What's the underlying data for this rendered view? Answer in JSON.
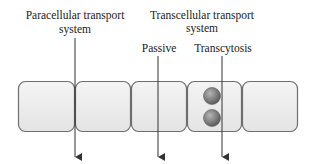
{
  "diagram": {
    "labels": {
      "paracellular_line1": "Paracellular transport",
      "paracellular_line2": "system",
      "transcellular_line1": "Transcellular transport",
      "transcellular_line2": "system",
      "passive": "Passive",
      "transcytosis": "Transcytosis"
    },
    "cells": [
      {
        "id": "cell-1",
        "has_vesicles": false
      },
      {
        "id": "cell-2",
        "has_vesicles": false
      },
      {
        "id": "cell-3",
        "has_vesicles": false
      },
      {
        "id": "cell-4",
        "has_vesicles": true,
        "vesicle_count": 2
      },
      {
        "id": "cell-5",
        "has_vesicles": false
      }
    ],
    "pathways": [
      {
        "name": "paracellular",
        "route": "between cells 1 and 2"
      },
      {
        "name": "passive",
        "route": "through cell 3"
      },
      {
        "name": "transcytosis",
        "route": "through cell 4"
      }
    ],
    "colors": {
      "cell_fill": "#ececec",
      "cell_stroke": "#6e6e6e",
      "arrow": "#333333",
      "vesicle": "#7a7a7a",
      "text": "#222222"
    }
  }
}
